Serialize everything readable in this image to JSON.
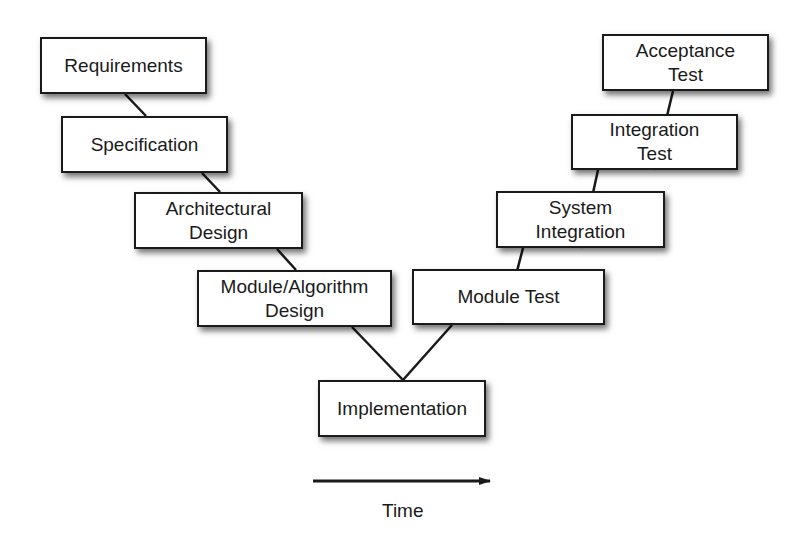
{
  "left_arm": [
    {
      "id": "requirements",
      "lines": [
        "Requirements"
      ],
      "x": 40,
      "y": 37,
      "w": 167,
      "h": 57
    },
    {
      "id": "specification",
      "lines": [
        "Specification"
      ],
      "x": 61,
      "y": 116,
      "w": 167,
      "h": 57
    },
    {
      "id": "architectural-design",
      "lines": [
        "Architectural",
        "Design"
      ],
      "x": 134,
      "y": 192,
      "w": 169,
      "h": 57
    },
    {
      "id": "module-algorithm-design",
      "lines": [
        "Module/Algorithm",
        "Design"
      ],
      "x": 197,
      "y": 270,
      "w": 195,
      "h": 57
    }
  ],
  "bottom": {
    "id": "implementation",
    "lines": [
      "Implementation"
    ],
    "x": 318,
    "y": 380,
    "w": 168,
    "h": 57
  },
  "right_arm": [
    {
      "id": "module-test",
      "lines": [
        "Module Test"
      ],
      "x": 412,
      "y": 269,
      "w": 193,
      "h": 56
    },
    {
      "id": "system-integration",
      "lines": [
        "System",
        "Integration"
      ],
      "x": 496,
      "y": 191,
      "w": 169,
      "h": 57
    },
    {
      "id": "integration-test",
      "lines": [
        "Integration",
        "Test"
      ],
      "x": 571,
      "y": 114,
      "w": 167,
      "h": 56
    },
    {
      "id": "acceptance-test",
      "lines": [
        "Acceptance",
        "Test"
      ],
      "x": 602,
      "y": 34,
      "w": 167,
      "h": 57
    }
  ],
  "connectors": [
    [
      125,
      94,
      146,
      116
    ],
    [
      202,
      173,
      220,
      192
    ],
    [
      277,
      249,
      296,
      270
    ],
    [
      352,
      327,
      403,
      380
    ],
    [
      403,
      380,
      452,
      325
    ],
    [
      503,
      325,
      523,
      248
    ],
    [
      581,
      248,
      598,
      170
    ],
    [
      654,
      170,
      673,
      91
    ]
  ],
  "time_axis": {
    "label": "Time",
    "x1": 313,
    "x2": 490,
    "y": 481,
    "label_x": 382,
    "label_y": 500
  },
  "colors": {
    "stroke": "#1a1a1a",
    "fill": "#ffffff",
    "text": "#1a1a1a"
  }
}
